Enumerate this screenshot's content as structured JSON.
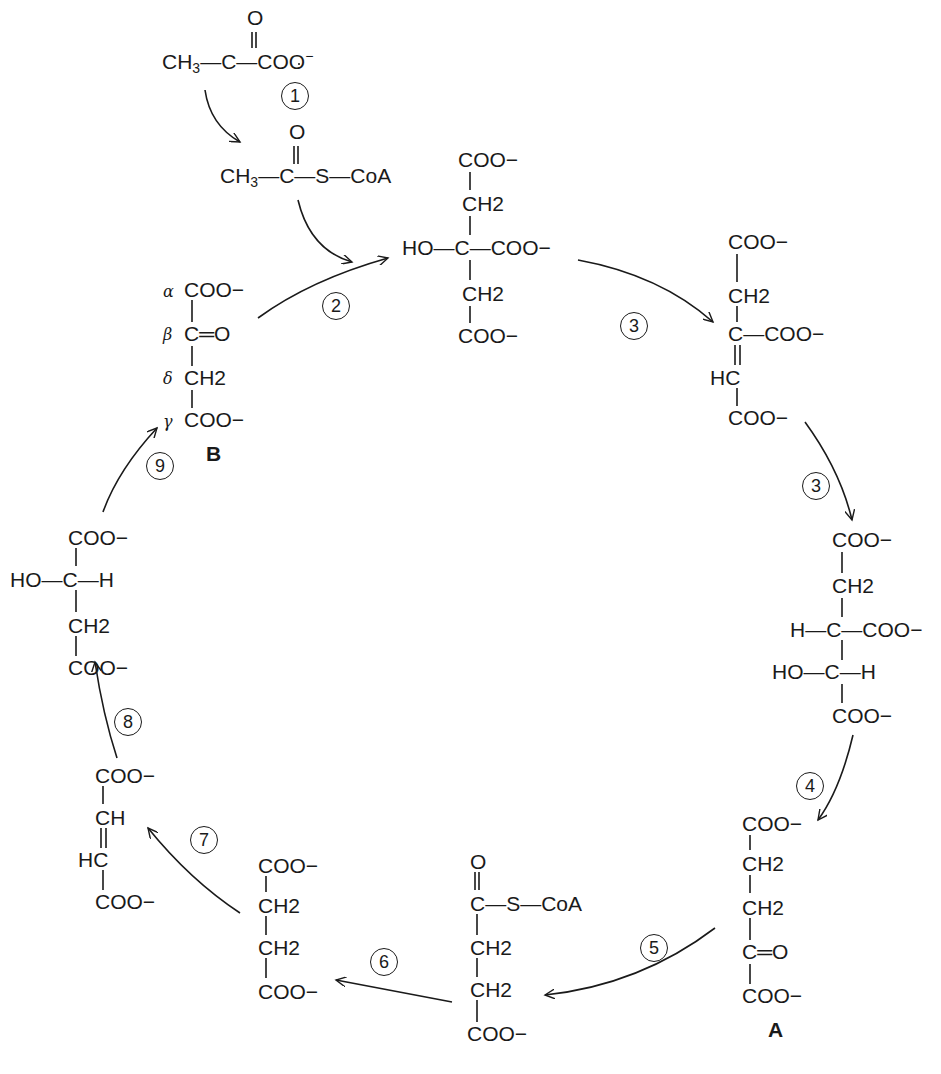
{
  "diagram": {
    "type": "metabolic-cycle",
    "steps": [
      "1",
      "2",
      "3",
      "3",
      "4",
      "5",
      "6",
      "7",
      "8",
      "9"
    ],
    "molecules": {
      "pyruvate": {
        "row1": "O",
        "row2": [
          "CH",
          "3",
          "—C—COO",
          "−"
        ]
      },
      "acetyl_coa": {
        "row1": "O",
        "row2": [
          "CH",
          "3",
          "—C—S—CoA"
        ]
      },
      "citrate": {
        "rows": [
          "COO−",
          "CH2",
          "HO—C—COO−",
          "CH2",
          "COO−"
        ]
      },
      "cis_aconitate": {
        "rows": [
          "COO−",
          "CH2",
          "C—COO−",
          "HC",
          "COO−"
        ]
      },
      "isocitrate": {
        "rows": [
          "COO−",
          "CH2",
          "H—C—COO−",
          "HO—C—H",
          "COO−"
        ]
      },
      "alpha_ketoglutarate": {
        "label": "A",
        "rows": [
          "COO−",
          "CH2",
          "CH2",
          "C═O",
          "COO−"
        ]
      },
      "succinyl_coa": {
        "rows": [
          "O",
          "C—S—CoA",
          "CH2",
          "CH2",
          "COO−"
        ]
      },
      "succinate": {
        "rows": [
          "COO−",
          "CH2",
          "CH2",
          "COO−"
        ]
      },
      "fumarate": {
        "rows": [
          "COO−",
          "CH",
          "HC",
          "COO−"
        ]
      },
      "malate": {
        "rows": [
          "COO−",
          "HO—C—H",
          "CH2",
          "COO−"
        ]
      },
      "oxaloacetate": {
        "label": "B",
        "greek": [
          "α",
          "β",
          "δ",
          "γ"
        ],
        "rows": [
          "COO−",
          "C═O",
          "CH2",
          "COO−"
        ]
      }
    }
  }
}
